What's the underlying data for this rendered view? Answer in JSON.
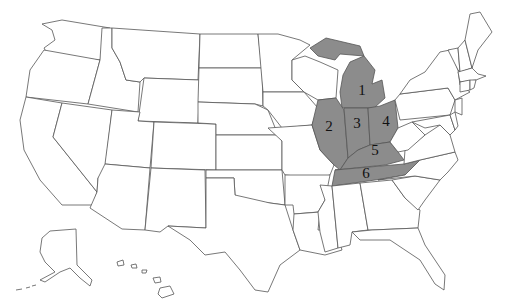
{
  "map": {
    "title": "United States map with highlighted region",
    "highlight_color": "#8c8c8c",
    "outline_color": "#555555",
    "background": "#ffffff",
    "regions": [
      {
        "number": "1",
        "state": "Michigan"
      },
      {
        "number": "2",
        "state": "Illinois"
      },
      {
        "number": "3",
        "state": "Indiana"
      },
      {
        "number": "4",
        "state": "Ohio"
      },
      {
        "number": "5",
        "state": "Kentucky"
      },
      {
        "number": "6",
        "state": "Tennessee"
      }
    ],
    "labels": {
      "r1": "1",
      "r2": "2",
      "r3": "3",
      "r4": "4",
      "r5": "5",
      "r6": "6"
    }
  }
}
